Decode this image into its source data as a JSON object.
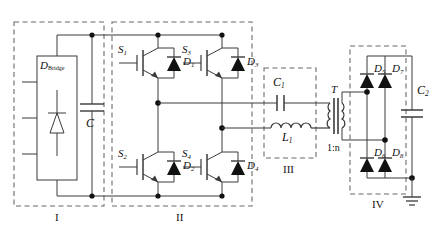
{
  "figure": {
    "type": "circuit-schematic",
    "width": 440,
    "height": 239,
    "line_color": "#3a3a3a",
    "dash_color": "#6b6b6b",
    "text_color": "#111111",
    "background": "#ffffff"
  },
  "sections": [
    {
      "id": "I",
      "label": "I",
      "name": "input-rectifier-stage"
    },
    {
      "id": "II",
      "label": "II",
      "name": "full-bridge-inverter-stage"
    },
    {
      "id": "III",
      "label": "III",
      "name": "resonant-tank-stage"
    },
    {
      "id": "IV",
      "label": "IV",
      "name": "output-rectifier-stage"
    }
  ],
  "components": {
    "input_bridge": {
      "label_main": "D",
      "label_sub": "Bridge",
      "name": "diode-bridge-rectifier"
    },
    "dc_link_cap": {
      "label_main": "C",
      "label_sub": "",
      "name": "dc-link-capacitor"
    },
    "switches": [
      {
        "label_main": "S",
        "label_sub": "1",
        "name": "igbt-s1",
        "position": "top-left"
      },
      {
        "label_main": "S",
        "label_sub": "3",
        "name": "igbt-s3",
        "position": "top-right"
      },
      {
        "label_main": "S",
        "label_sub": "2",
        "name": "igbt-s2",
        "position": "bottom-left"
      },
      {
        "label_main": "S",
        "label_sub": "4",
        "name": "igbt-s4",
        "position": "bottom-right"
      }
    ],
    "antiparallel_diodes": [
      {
        "label_main": "D",
        "label_sub": "1",
        "name": "diode-d1",
        "position": "top-left"
      },
      {
        "label_main": "D",
        "label_sub": "3",
        "name": "diode-d3",
        "position": "top-right"
      },
      {
        "label_main": "D",
        "label_sub": "2",
        "name": "diode-d2",
        "position": "bottom-left"
      },
      {
        "label_main": "D",
        "label_sub": "4",
        "name": "diode-d4",
        "position": "bottom-right"
      }
    ],
    "resonant_cap": {
      "label_main": "C",
      "label_sub": "1",
      "name": "resonant-capacitor-c1"
    },
    "resonant_inductor": {
      "label_main": "L",
      "label_sub": "1",
      "name": "resonant-inductor-l1"
    },
    "transformer": {
      "label_main": "T",
      "label_sub": "",
      "turns_ratio": "1:n",
      "name": "isolation-transformer"
    },
    "output_diodes": [
      {
        "label_main": "D",
        "label_sub": "5",
        "name": "diode-d5",
        "position": "top-left"
      },
      {
        "label_main": "D",
        "label_sub": "7",
        "name": "diode-d7",
        "position": "top-right"
      },
      {
        "label_main": "D",
        "label_sub": "6",
        "name": "diode-d6",
        "position": "bottom-left"
      },
      {
        "label_main": "D",
        "label_sub": "8",
        "name": "diode-d8",
        "position": "bottom-right"
      }
    ],
    "output_cap": {
      "label_main": "C",
      "label_sub": "2",
      "name": "output-filter-capacitor-c2"
    },
    "ground": {
      "name": "ground-symbol"
    }
  }
}
